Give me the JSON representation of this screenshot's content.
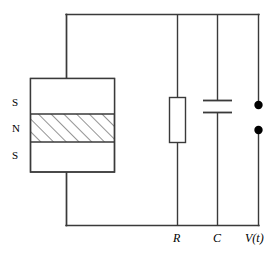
{
  "figure": {
    "type": "circuit-diagram",
    "background_color": "#ffffff",
    "line_color": "#3a3a3a",
    "fill_color": "#ffffff",
    "dot_color": "#000000"
  },
  "magnet": {
    "name": "layered-magnet",
    "layers": [
      {
        "label": "S",
        "fill": "none",
        "hatched": false
      },
      {
        "label": "N",
        "fill": "hatched",
        "hatched": true
      },
      {
        "label": "S",
        "fill": "none",
        "hatched": false
      }
    ]
  },
  "components": {
    "resistor": {
      "label": "R",
      "symbol": "rectangle-resistor"
    },
    "capacitor": {
      "label": "C",
      "symbol": "parallel-plate-capacitor"
    },
    "output": {
      "label": "V(t)",
      "label_plain": "V(t)",
      "symbol": "terminal-pair",
      "terminal_count": 2
    }
  },
  "labels": {
    "pole_top": "S",
    "pole_middle": "N",
    "pole_bottom": "S",
    "resistor": "R",
    "capacitor": "C",
    "voltage": "V(t)"
  }
}
